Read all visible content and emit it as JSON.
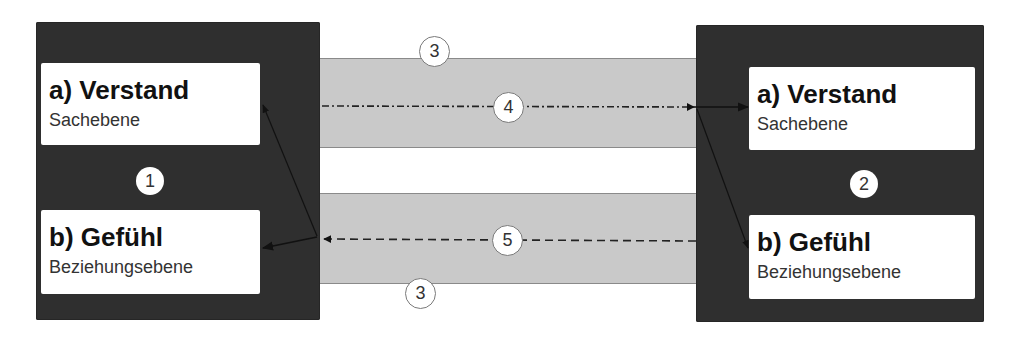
{
  "diagram": {
    "type": "communication-model",
    "sender": {
      "badge": "1",
      "levels": [
        {
          "title": "a) Verstand",
          "subtitle": "Sachebene"
        },
        {
          "title": "b) Gefühl",
          "subtitle": "Beziehungsebene"
        }
      ]
    },
    "receiver": {
      "badge": "2",
      "levels": [
        {
          "title": "a) Verstand",
          "subtitle": "Sachebene"
        },
        {
          "title": "b) Gefühl",
          "subtitle": "Beziehungsebene"
        }
      ]
    },
    "channels": [
      {
        "badge": "3",
        "position": "top-band",
        "label_location": "above"
      },
      {
        "badge": "3",
        "position": "bottom-band",
        "label_location": "below"
      }
    ],
    "flows": [
      {
        "badge": "4",
        "from": "sender",
        "to": "receiver.a",
        "line_style": "dash-dot",
        "direction": "left-to-right"
      },
      {
        "badge": "5",
        "from": "receiver",
        "to": "sender.b",
        "line_style": "dashed",
        "direction": "right-to-left"
      }
    ],
    "colors": {
      "panel": "#2f2f2f",
      "band": "#c9c9c9",
      "card": "#ffffff",
      "arrow": "#111111"
    }
  }
}
